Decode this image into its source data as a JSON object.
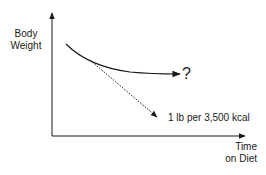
{
  "diagram": {
    "y_axis_label_line1": "Body",
    "y_axis_label_line2": "Weight",
    "x_axis_label_line1": "Time",
    "x_axis_label_line2": "on Diet",
    "actual_curve_label": "?",
    "predicted_line_label": "1 lb per 3,500 kcal",
    "colors": {
      "line": "#1a1a1a",
      "background": "#ffffff"
    }
  }
}
